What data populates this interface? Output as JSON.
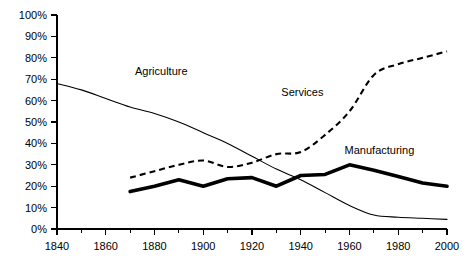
{
  "chart_data": {
    "type": "line",
    "title": "",
    "subtitle": "",
    "xlabel": "",
    "ylabel": "",
    "xlim": [
      1840,
      2000
    ],
    "ylim": [
      0,
      100
    ],
    "grid": false,
    "legend_position": "inline-annotations",
    "y_tick_labels": [
      "0%",
      "10%",
      "20%",
      "30%",
      "40%",
      "50%",
      "60%",
      "70%",
      "80%",
      "90%",
      "100%"
    ],
    "y_tick_values": [
      0,
      10,
      20,
      30,
      40,
      50,
      60,
      70,
      80,
      90,
      100
    ],
    "x_tick_labels": [
      "1840",
      "1860",
      "1880",
      "1900",
      "1920",
      "1940",
      "1960",
      "1980",
      "2000"
    ],
    "x_tick_values": [
      1840,
      1860,
      1880,
      1900,
      1920,
      1940,
      1960,
      1980,
      2000
    ],
    "x_minor_tick_values": [
      1850,
      1870,
      1890,
      1910,
      1930,
      1950,
      1970,
      1990
    ],
    "series": [
      {
        "name": "Agriculture",
        "style": "thin-solid",
        "color": "#000000",
        "label_x": 1872,
        "label_y": 72,
        "x": [
          1840,
          1850,
          1860,
          1870,
          1880,
          1890,
          1900,
          1910,
          1920,
          1930,
          1940,
          1950,
          1960,
          1970,
          1980,
          1990,
          2000
        ],
        "values": [
          68,
          65,
          61,
          57,
          54,
          50,
          45,
          40,
          34,
          28,
          23,
          17,
          11,
          6.5,
          5.5,
          5,
          4.5
        ]
      },
      {
        "name": "Services",
        "style": "dashed",
        "color": "#000000",
        "label_x": 1932,
        "label_y": 62,
        "x": [
          1870,
          1880,
          1890,
          1900,
          1910,
          1920,
          1930,
          1940,
          1950,
          1960,
          1970,
          1980,
          1990,
          2000
        ],
        "values": [
          24,
          27,
          30,
          32,
          29,
          31,
          35,
          36,
          44,
          55,
          72,
          77,
          80,
          83
        ]
      },
      {
        "name": "Manufacturing",
        "style": "thick-solid",
        "color": "#000000",
        "label_x": 1958,
        "label_y": 35,
        "x": [
          1870,
          1880,
          1890,
          1900,
          1910,
          1920,
          1930,
          1940,
          1950,
          1960,
          1970,
          1980,
          1990,
          2000
        ],
        "values": [
          17.5,
          20,
          23,
          20,
          23.5,
          24,
          20,
          25,
          25.5,
          30,
          27.5,
          24.5,
          21.5,
          20
        ]
      }
    ]
  }
}
